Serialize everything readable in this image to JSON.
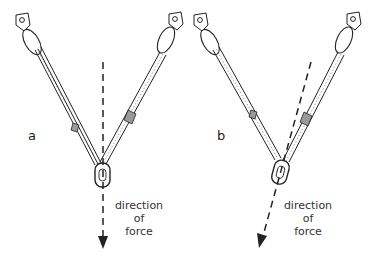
{
  "panels": [
    {
      "id": "a",
      "label": "a",
      "caption_line1": "direction of",
      "caption_line2": "force"
    },
    {
      "id": "b",
      "label": "b",
      "caption_line1": "direction of",
      "caption_line2": "force"
    }
  ],
  "colors": {
    "line": "#222222",
    "background": "#ffffff"
  }
}
